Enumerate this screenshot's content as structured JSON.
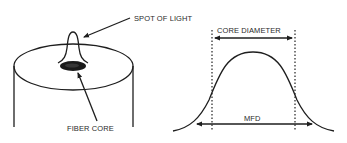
{
  "diagram": {
    "left_panel": {
      "subject": "optical fiber end face",
      "labels": {
        "spot_of_light": "SPOT OF LIGHT",
        "fiber_core": "FIBER CORE"
      }
    },
    "right_panel": {
      "subject": "light intensity profile across fiber",
      "labels": {
        "core_diameter": "CORE DIAMETER",
        "mfd": "MFD"
      }
    },
    "colors": {
      "ink": "#1e1e1e",
      "background": "#ffffff"
    }
  }
}
